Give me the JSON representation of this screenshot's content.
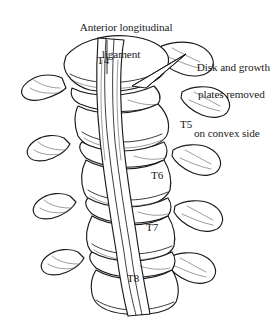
{
  "figure": {
    "type": "anatomical-line-drawing",
    "stroke_color": "#1a1a1a",
    "fill_color": "#ffffff",
    "shade_color": "#e8e8e8"
  },
  "annotations": {
    "ligament": {
      "line1": "Anterior longitudinal",
      "line2": "ligament"
    },
    "disk": {
      "line1": "Disk and growth",
      "line2": "plates removed",
      "line3": "on convex side"
    }
  },
  "vertebrae": {
    "t4": "T4",
    "t5": "T5",
    "t6": "T6",
    "t7": "T7",
    "t8": "T8"
  }
}
